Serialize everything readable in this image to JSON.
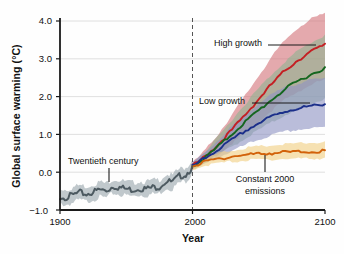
{
  "chart_data": {
    "type": "line",
    "title": "",
    "xlabel": "Year",
    "ylabel": "Global surface warming (°C)",
    "xlim": [
      1900,
      2100
    ],
    "ylim": [
      -1.0,
      4.0
    ],
    "grid": true,
    "legend_position": "inline-annotations",
    "xticks": [
      "1900",
      "2000",
      "2100"
    ],
    "xtick_values": [
      1900,
      2000,
      2100
    ],
    "yticks": [
      "4.0",
      "3.0",
      "2.0",
      "1.0",
      "0.0",
      "−1.0"
    ],
    "ytick_values": [
      4.0,
      3.0,
      2.0,
      1.0,
      0.0,
      -1.0
    ],
    "reference_line": {
      "x": 2000,
      "style": "dashed",
      "color": "#555555"
    },
    "annotations": [
      {
        "name": "twentieth-century",
        "text": "Twentieth century",
        "x": 1947,
        "y": 1.02
      },
      {
        "name": "high-growth",
        "text": "High growth",
        "x": 2031,
        "y": 2.95
      },
      {
        "name": "low-growth",
        "text": "Low growth",
        "x": 2027,
        "y": 1.35
      },
      {
        "name": "constant-2000-emissions",
        "text": "Constant 2000",
        "text2": "emissions",
        "x": 2052,
        "y": -0.25
      }
    ],
    "series": [
      {
        "name": "Twentieth century",
        "color": "#4d5a61",
        "band_color": "#9aa6ad",
        "x": [
          1900,
          1905,
          1910,
          1915,
          1920,
          1925,
          1930,
          1935,
          1940,
          1945,
          1950,
          1955,
          1960,
          1965,
          1970,
          1975,
          1980,
          1985,
          1990,
          1995,
          2000
        ],
        "values": [
          -0.6,
          -0.62,
          -0.56,
          -0.5,
          -0.54,
          -0.48,
          -0.42,
          -0.45,
          -0.33,
          -0.36,
          -0.4,
          -0.42,
          -0.38,
          -0.4,
          -0.36,
          -0.34,
          -0.2,
          -0.22,
          -0.06,
          -0.02,
          0.18
        ],
        "band_lower": [
          -0.8,
          -0.82,
          -0.76,
          -0.7,
          -0.74,
          -0.68,
          -0.62,
          -0.64,
          -0.52,
          -0.55,
          -0.58,
          -0.6,
          -0.56,
          -0.58,
          -0.54,
          -0.52,
          -0.38,
          -0.4,
          -0.24,
          -0.2,
          0.02
        ],
        "band_upper": [
          -0.4,
          -0.42,
          -0.36,
          -0.3,
          -0.34,
          -0.28,
          -0.22,
          -0.26,
          -0.14,
          -0.17,
          -0.22,
          -0.24,
          -0.2,
          -0.22,
          -0.18,
          -0.16,
          -0.02,
          -0.04,
          0.12,
          0.16,
          0.34
        ]
      },
      {
        "name": "High growth",
        "color": "#c41f23",
        "band_color": "#d4757a",
        "x": [
          2000,
          2010,
          2020,
          2030,
          2040,
          2050,
          2060,
          2070,
          2080,
          2090,
          2100
        ],
        "values": [
          0.18,
          0.45,
          0.78,
          1.15,
          1.55,
          1.96,
          2.36,
          2.72,
          3.0,
          3.22,
          3.4
        ],
        "band_lower": [
          0.1,
          0.3,
          0.52,
          0.78,
          1.06,
          1.36,
          1.66,
          1.94,
          2.16,
          2.34,
          2.48
        ],
        "band_upper": [
          0.26,
          0.62,
          1.06,
          1.55,
          2.06,
          2.58,
          3.08,
          3.52,
          3.86,
          4.08,
          4.22
        ]
      },
      {
        "name": "Medium growth",
        "color": "#14661f",
        "band_color": "#8fb391",
        "x": [
          2000,
          2010,
          2020,
          2030,
          2040,
          2050,
          2060,
          2070,
          2080,
          2090,
          2100
        ],
        "values": [
          0.18,
          0.42,
          0.72,
          1.04,
          1.36,
          1.66,
          1.95,
          2.22,
          2.44,
          2.62,
          2.78
        ],
        "band_lower": [
          0.1,
          0.28,
          0.48,
          0.7,
          0.92,
          1.14,
          1.34,
          1.54,
          1.7,
          1.84,
          1.96
        ],
        "band_upper": [
          0.26,
          0.58,
          0.98,
          1.42,
          1.84,
          2.24,
          2.62,
          2.96,
          3.24,
          3.46,
          3.64
        ]
      },
      {
        "name": "Low growth",
        "color": "#1b2f8a",
        "band_color": "#8f95c4",
        "x": [
          2000,
          2010,
          2020,
          2030,
          2040,
          2050,
          2060,
          2070,
          2080,
          2090,
          2100
        ],
        "values": [
          0.18,
          0.4,
          0.64,
          0.88,
          1.12,
          1.32,
          1.5,
          1.63,
          1.72,
          1.77,
          1.8
        ],
        "band_lower": [
          0.1,
          0.26,
          0.42,
          0.58,
          0.74,
          0.88,
          1.0,
          1.09,
          1.15,
          1.18,
          1.2
        ],
        "band_upper": [
          0.26,
          0.56,
          0.9,
          1.24,
          1.56,
          1.84,
          2.08,
          2.26,
          2.38,
          2.46,
          2.5
        ]
      },
      {
        "name": "Constant 2000 emissions",
        "color": "#d2620a",
        "band_color": "#f0cf83",
        "x": [
          2000,
          2010,
          2020,
          2030,
          2040,
          2050,
          2060,
          2070,
          2080,
          2090,
          2100
        ],
        "values": [
          0.18,
          0.3,
          0.38,
          0.44,
          0.48,
          0.51,
          0.53,
          0.55,
          0.56,
          0.57,
          0.58
        ],
        "band_lower": [
          0.1,
          0.2,
          0.26,
          0.3,
          0.33,
          0.35,
          0.36,
          0.37,
          0.38,
          0.38,
          0.39
        ],
        "band_upper": [
          0.26,
          0.42,
          0.52,
          0.6,
          0.66,
          0.7,
          0.73,
          0.76,
          0.78,
          0.8,
          0.82
        ]
      }
    ]
  }
}
